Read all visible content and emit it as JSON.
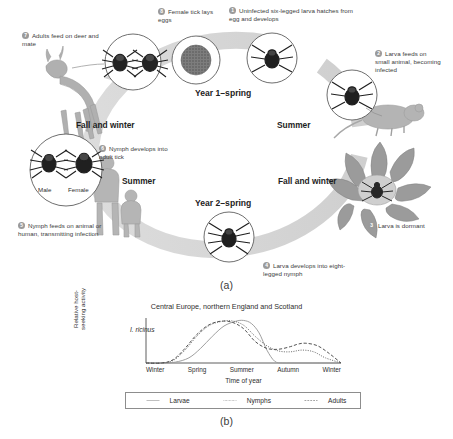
{
  "figure": {
    "panel_a_caption": "(a)",
    "panel_b_caption": "(b)"
  },
  "life_cycle": {
    "title": "Tick (Ixodes) two-year life cycle",
    "year_labels": [
      {
        "id": "year1",
        "text": "Year 1–spring"
      },
      {
        "id": "year2",
        "text": "Year 2–spring"
      }
    ],
    "seasons": [
      {
        "id": "season-summer-right",
        "text": "Summer"
      },
      {
        "id": "season-fall-winter-right",
        "text": "Fall and winter"
      },
      {
        "id": "season-summer-left",
        "text": "Summer"
      },
      {
        "id": "season-fall-winter-left",
        "text": "Fall and winter"
      }
    ],
    "steps": [
      {
        "number": "1",
        "text": "Uninfected six-legged larva hatches from egg and develops"
      },
      {
        "number": "2",
        "text": "Larva feeds on small animal, becoming infected"
      },
      {
        "number": "3",
        "text": "Larva is dormant"
      },
      {
        "number": "4",
        "text": "Larva develops into eight-legged nymph"
      },
      {
        "number": "5",
        "text": "Nymph feeds on animal or human, transmitting infection"
      },
      {
        "number": "6",
        "text": "Nymph develops into adult tick"
      },
      {
        "number": "7",
        "text": "Adults feed on deer and mate"
      },
      {
        "number": "8",
        "text": "Female tick lays eggs"
      }
    ],
    "sex_labels": [
      {
        "id": "male",
        "text": "Male"
      },
      {
        "id": "female",
        "text": "Female"
      }
    ],
    "colors": {
      "ring": "#d2d2d2",
      "badge": "#9a9a9a",
      "tick_body": "#2f2f2f",
      "illustration": "#a9a9a9"
    }
  },
  "chart_data": {
    "type": "line",
    "title": "Central Europe, northern England and Scotland",
    "annotation": "I. ricinus",
    "xlabel": "Time of year",
    "ylabel": "Relative host-seeking activity",
    "x_ticks": [
      "Winter",
      "Spring",
      "Summer",
      "Autumn",
      "Winter"
    ],
    "grid": false,
    "ylim": [
      0,
      1
    ],
    "legend_position": "bottom",
    "series": [
      {
        "name": "Larvae",
        "style": "solid",
        "color": "#9a9a9a",
        "x": [
          0,
          8,
          15,
          22,
          28,
          34,
          40,
          46,
          50,
          54,
          58,
          62,
          66,
          70,
          74,
          78,
          84,
          90,
          100
        ],
        "values": [
          0,
          0,
          0.02,
          0.12,
          0.34,
          0.62,
          0.86,
          0.97,
          0.99,
          0.92,
          0.7,
          0.3,
          0.04,
          0.0,
          0.0,
          0.0,
          0.0,
          0.0,
          0.0
        ]
      },
      {
        "name": "Nymphs",
        "style": "dotted",
        "color": "#6d6d6d",
        "x": [
          0,
          8,
          14,
          20,
          26,
          32,
          38,
          44,
          50,
          56,
          62,
          68,
          74,
          80,
          86,
          92,
          100
        ],
        "values": [
          0,
          0,
          0.06,
          0.3,
          0.62,
          0.86,
          0.96,
          0.98,
          0.88,
          0.62,
          0.4,
          0.28,
          0.26,
          0.3,
          0.26,
          0.12,
          0.0
        ]
      },
      {
        "name": "Adults",
        "style": "dashed",
        "color": "#4a4a4a",
        "x": [
          0,
          8,
          14,
          20,
          26,
          32,
          38,
          44,
          50,
          56,
          62,
          68,
          74,
          78,
          82,
          88,
          94,
          100
        ],
        "values": [
          0,
          0,
          0.08,
          0.34,
          0.66,
          0.88,
          0.97,
          0.95,
          0.8,
          0.5,
          0.34,
          0.32,
          0.38,
          0.44,
          0.46,
          0.4,
          0.22,
          0.0
        ]
      }
    ]
  }
}
